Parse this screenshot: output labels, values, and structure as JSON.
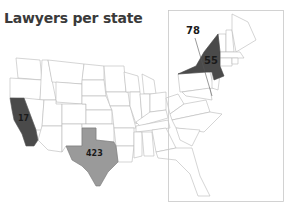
{
  "title": "Lawyers per state",
  "colors": {
    "dark": "#4a4a4a",
    "medium": "#9a9a9a",
    "base": "#ffffff",
    "border": "#b8b8b8",
    "inset_border": "#c8c8c8"
  },
  "states": [
    {
      "name": "California",
      "value": "17",
      "shade": "dark"
    },
    {
      "name": "Texas",
      "value": "423",
      "shade": "medium"
    },
    {
      "name": "New York",
      "value": "55",
      "shade": "dark"
    },
    {
      "name": "District of Columbia",
      "value": "78",
      "shade": "callout"
    }
  ]
}
